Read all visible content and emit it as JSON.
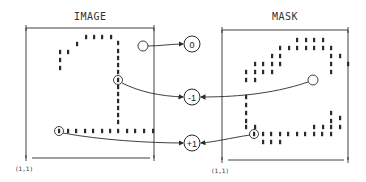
{
  "image_panel": {
    "title": "IMAGE",
    "origin_label": "(1,1)",
    "frame": {
      "x1": 26,
      "y1": 28,
      "x2": 154,
      "y2": 158
    },
    "dots": [
      [
        86,
        37
      ],
      [
        94,
        37
      ],
      [
        102,
        37
      ],
      [
        111,
        37
      ],
      [
        77,
        44
      ],
      [
        60,
        52
      ],
      [
        68,
        52
      ],
      [
        60,
        60
      ],
      [
        60,
        68
      ],
      [
        118,
        43
      ],
      [
        118,
        51
      ],
      [
        118,
        58
      ],
      [
        118,
        65
      ],
      [
        118,
        72
      ],
      [
        118,
        87
      ],
      [
        118,
        94
      ],
      [
        118,
        101
      ],
      [
        118,
        108
      ],
      [
        118,
        115
      ],
      [
        118,
        122
      ],
      [
        68,
        131
      ],
      [
        76,
        131
      ],
      [
        85,
        131
      ],
      [
        93,
        131
      ],
      [
        102,
        131
      ],
      [
        110,
        131
      ],
      [
        118,
        131
      ],
      [
        127,
        131
      ],
      [
        135,
        131
      ],
      [
        144,
        131
      ],
      [
        153,
        131
      ]
    ],
    "empty_circle": {
      "cx": 143,
      "cy": 46,
      "r": 5
    },
    "marked_points": [
      {
        "cx": 118,
        "cy": 80,
        "r": 4.5
      },
      {
        "cx": 59,
        "cy": 131,
        "r": 4.5
      }
    ]
  },
  "mask_panel": {
    "title": "MASK",
    "origin_label": "(1,1)",
    "frame": {
      "x1": 222,
      "y1": 30,
      "x2": 348,
      "y2": 160
    },
    "dots": [
      [
        297,
        40
      ],
      [
        306,
        40
      ],
      [
        314,
        40
      ],
      [
        323,
        40
      ],
      [
        280,
        48
      ],
      [
        289,
        48
      ],
      [
        297,
        48
      ],
      [
        306,
        48
      ],
      [
        314,
        48
      ],
      [
        323,
        48
      ],
      [
        331,
        48
      ],
      [
        272,
        56
      ],
      [
        280,
        56
      ],
      [
        331,
        56
      ],
      [
        340,
        56
      ],
      [
        255,
        64
      ],
      [
        263,
        64
      ],
      [
        272,
        64
      ],
      [
        280,
        64
      ],
      [
        331,
        64
      ],
      [
        348,
        64
      ],
      [
        246,
        72
      ],
      [
        255,
        72
      ],
      [
        263,
        72
      ],
      [
        272,
        72
      ],
      [
        331,
        72
      ],
      [
        246,
        80
      ],
      [
        255,
        80
      ],
      [
        246,
        97
      ],
      [
        246,
        105
      ],
      [
        246,
        113
      ],
      [
        246,
        121
      ],
      [
        246,
        127
      ],
      [
        255,
        127
      ],
      [
        263,
        134
      ],
      [
        271,
        134
      ],
      [
        280,
        134
      ],
      [
        288,
        134
      ],
      [
        297,
        134
      ],
      [
        305,
        134
      ],
      [
        314,
        134
      ],
      [
        322,
        134
      ],
      [
        331,
        134
      ],
      [
        314,
        127
      ],
      [
        323,
        127
      ],
      [
        331,
        127
      ],
      [
        331,
        121
      ],
      [
        340,
        118
      ],
      [
        340,
        127
      ],
      [
        331,
        113
      ],
      [
        263,
        142
      ],
      [
        271,
        142
      ],
      [
        280,
        142
      ]
    ],
    "empty_circle": {
      "cx": 313,
      "cy": 80,
      "r": 5
    },
    "marked_points": [
      {
        "cx": 254,
        "cy": 134,
        "r": 4.5
      }
    ]
  },
  "nodes": [
    {
      "label": "0",
      "cx": 192,
      "cy": 44,
      "r": 8
    },
    {
      "label": "-1",
      "cx": 192,
      "cy": 97,
      "r": 8
    },
    {
      "label": "+1",
      "cx": 192,
      "cy": 143,
      "r": 8
    }
  ],
  "connectors": [
    {
      "from": "image-empty-circle",
      "to": "node-0",
      "d": "M148,46 C160,46 170,44 183,44"
    },
    {
      "from": "image-marked-point-1",
      "to": "node-minus-1",
      "d": "M122,83 C140,92 160,96 183,97"
    },
    {
      "from": "mask-empty-circle",
      "to": "node-minus-1",
      "d": "M308,82 C270,95 230,97 201,97"
    },
    {
      "from": "image-marked-point-2",
      "to": "node-plus-1",
      "d": "M63,133 C100,140 150,143 183,143"
    },
    {
      "from": "mask-marked-point",
      "to": "node-plus-1",
      "d": "M250,135 C230,138 215,142 201,143"
    }
  ],
  "colors": {
    "ink": "#2a2a2a",
    "background": "#ffffff"
  }
}
